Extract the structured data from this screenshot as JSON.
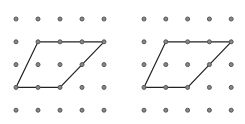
{
  "figure": {
    "dot_color": "#555555",
    "dot_fill": "#888888",
    "line_color": "#222222",
    "grids": [
      {
        "name": "left-grid",
        "origin_x": 16,
        "origin_y": 19,
        "spacing_x": 22,
        "spacing_y": 22.8,
        "cols": 5,
        "rows": 5,
        "parallelogram": [
          [
            1,
            1
          ],
          [
            4,
            1
          ],
          [
            2,
            3
          ],
          [
            0,
            3
          ]
        ]
      },
      {
        "name": "right-grid",
        "origin_x": 144,
        "origin_y": 19,
        "spacing_x": 21.8,
        "spacing_y": 22.8,
        "cols": 5,
        "rows": 5,
        "parallelogram": [
          [
            1,
            1
          ],
          [
            4,
            1
          ],
          [
            2,
            3
          ],
          [
            0,
            3
          ]
        ]
      }
    ]
  }
}
